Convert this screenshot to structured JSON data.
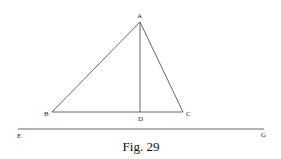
{
  "diagram": {
    "caption": "Fig. 29",
    "stroke_color": "#555555",
    "points": {
      "A": {
        "label": "A",
        "x": 140,
        "y": 22
      },
      "B": {
        "label": "B",
        "x": 52,
        "y": 112
      },
      "C": {
        "label": "C",
        "x": 183,
        "y": 112
      },
      "D": {
        "label": "D",
        "x": 140,
        "y": 112
      }
    },
    "line_EG": {
      "E": {
        "label": "E",
        "x": 18,
        "y": 129
      },
      "G": {
        "label": "G",
        "x": 264,
        "y": 129
      }
    },
    "segments": [
      "AB",
      "AC",
      "BC",
      "AD",
      "EG"
    ]
  }
}
